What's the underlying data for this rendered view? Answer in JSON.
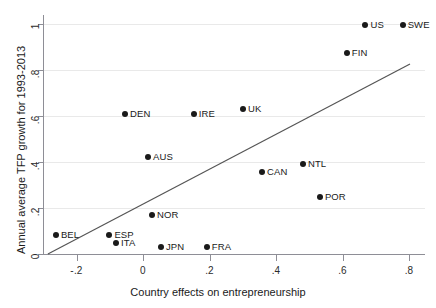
{
  "chart_data": {
    "type": "scatter",
    "title": "",
    "xlabel": "Country effects on entrepreneurship",
    "ylabel": "Annual average TFP growth for 1993-2013",
    "xlim": [
      -0.29,
      0.845
    ],
    "ylim": [
      -0.015,
      1.03
    ],
    "xticks": [
      -0.2,
      0,
      0.2,
      0.4,
      0.6,
      0.8
    ],
    "xticklabels": [
      "-.2",
      "0",
      ".2",
      ".4",
      ".6",
      ".8"
    ],
    "yticks": [
      0,
      0.2,
      0.4,
      0.6,
      0.8,
      1
    ],
    "yticklabels": [
      "0",
      ".2",
      ".4",
      ".6",
      ".8",
      "1"
    ],
    "grid": "horizontal",
    "legend": "none",
    "marker_color": "#1a1a1a",
    "line_color": "#555555",
    "grid_color": "#e9e9e9",
    "points": [
      {
        "label": "BEL",
        "x": -0.262,
        "y": 0.083,
        "label_side": "right"
      },
      {
        "label": "ESP",
        "x": -0.101,
        "y": 0.083,
        "label_side": "right"
      },
      {
        "label": "ITA",
        "x": -0.081,
        "y": 0.05,
        "label_side": "right"
      },
      {
        "label": "DEN",
        "x": -0.054,
        "y": 0.61,
        "label_side": "right"
      },
      {
        "label": "AUS",
        "x": 0.015,
        "y": 0.422,
        "label_side": "right"
      },
      {
        "label": "NOR",
        "x": 0.027,
        "y": 0.17,
        "label_side": "right"
      },
      {
        "label": "JPN",
        "x": 0.054,
        "y": 0.03,
        "label_side": "right"
      },
      {
        "label": "IRE",
        "x": 0.153,
        "y": 0.61,
        "label_side": "right"
      },
      {
        "label": "FRA",
        "x": 0.192,
        "y": 0.03,
        "label_side": "right"
      },
      {
        "label": "UK",
        "x": 0.301,
        "y": 0.63,
        "label_side": "right"
      },
      {
        "label": "CAN",
        "x": 0.358,
        "y": 0.357,
        "label_side": "right"
      },
      {
        "label": "NTL",
        "x": 0.481,
        "y": 0.392,
        "label_side": "right"
      },
      {
        "label": "POR",
        "x": 0.532,
        "y": 0.248,
        "label_side": "right"
      },
      {
        "label": "FIN",
        "x": 0.613,
        "y": 0.874,
        "label_side": "right"
      },
      {
        "label": "US",
        "x": 0.669,
        "y": 0.996,
        "label_side": "right"
      },
      {
        "label": "SWE",
        "x": 0.781,
        "y": 0.996,
        "label_side": "right"
      }
    ],
    "fit_line": {
      "type": "linear-fit",
      "x_start": -0.286,
      "y_start": 0.0,
      "x_end": 0.803,
      "y_end": 0.826
    }
  }
}
